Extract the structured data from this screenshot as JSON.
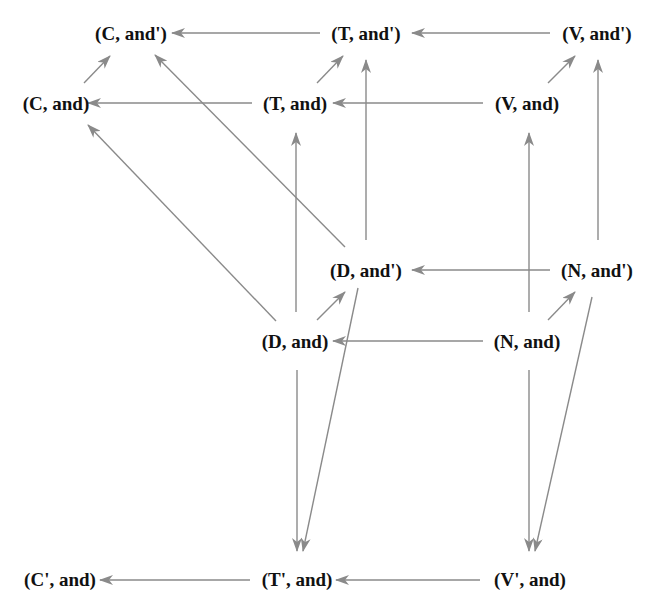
{
  "diagram": {
    "edge_color": "#8a8a8a",
    "text_color": "#111111",
    "nodes": {
      "c_andp": {
        "label": "(C, and')",
        "x": 131,
        "y": 33
      },
      "t_andp": {
        "label": "(T, and')",
        "x": 366,
        "y": 33
      },
      "v_andp": {
        "label": "(V, and')",
        "x": 597,
        "y": 33
      },
      "c_and": {
        "label": "(C, and)",
        "x": 56,
        "y": 103
      },
      "t_and": {
        "label": "(T, and)",
        "x": 295,
        "y": 103
      },
      "v_and": {
        "label": "(V, and)",
        "x": 527,
        "y": 103
      },
      "d_andp": {
        "label": "(D, and')",
        "x": 366,
        "y": 270
      },
      "n_andp": {
        "label": "(N, and')",
        "x": 597,
        "y": 270
      },
      "d_and": {
        "label": "(D, and)",
        "x": 295,
        "y": 341
      },
      "n_and": {
        "label": "(N, and)",
        "x": 527,
        "y": 341
      },
      "cp_and": {
        "label": "(C', and)",
        "x": 60,
        "y": 579
      },
      "tp_and": {
        "label": "(T', and)",
        "x": 297,
        "y": 579
      },
      "vp_and": {
        "label": "(V', and)",
        "x": 530,
        "y": 579
      }
    },
    "edges": [
      {
        "from": "t_andp",
        "to": "c_andp",
        "x1": 320,
        "y1": 33,
        "x2": 172,
        "y2": 33
      },
      {
        "from": "v_andp",
        "to": "t_andp",
        "x1": 550,
        "y1": 33,
        "x2": 412,
        "y2": 33
      },
      {
        "from": "t_and",
        "to": "c_and",
        "x1": 252,
        "y1": 103,
        "x2": 88,
        "y2": 103
      },
      {
        "from": "v_and",
        "to": "t_and",
        "x1": 483,
        "y1": 103,
        "x2": 333,
        "y2": 103
      },
      {
        "from": "c_and",
        "to": "c_andp",
        "x1": 84,
        "y1": 83,
        "x2": 110,
        "y2": 56
      },
      {
        "from": "t_and",
        "to": "t_andp",
        "x1": 317,
        "y1": 83,
        "x2": 343,
        "y2": 56
      },
      {
        "from": "v_and",
        "to": "v_andp",
        "x1": 548,
        "y1": 83,
        "x2": 575,
        "y2": 56
      },
      {
        "from": "d_andp",
        "to": "c_andp",
        "x1": 345,
        "y1": 247,
        "x2": 155,
        "y2": 55
      },
      {
        "from": "d_and",
        "to": "c_and",
        "x1": 276,
        "y1": 321,
        "x2": 88,
        "y2": 125
      },
      {
        "from": "d_andp",
        "to": "t_andp",
        "x1": 366,
        "y1": 240,
        "x2": 366,
        "y2": 60
      },
      {
        "from": "d_and",
        "to": "t_and",
        "x1": 296,
        "y1": 312,
        "x2": 296,
        "y2": 133
      },
      {
        "from": "n_andp",
        "to": "v_andp",
        "x1": 598,
        "y1": 240,
        "x2": 598,
        "y2": 60
      },
      {
        "from": "n_and",
        "to": "v_and",
        "x1": 529,
        "y1": 312,
        "x2": 529,
        "y2": 133
      },
      {
        "from": "n_andp",
        "to": "d_andp",
        "x1": 550,
        "y1": 270,
        "x2": 412,
        "y2": 270
      },
      {
        "from": "n_and",
        "to": "d_and",
        "x1": 483,
        "y1": 341,
        "x2": 333,
        "y2": 341
      },
      {
        "from": "d_and",
        "to": "d_andp",
        "x1": 317,
        "y1": 320,
        "x2": 345,
        "y2": 292
      },
      {
        "from": "n_and",
        "to": "n_andp",
        "x1": 548,
        "y1": 320,
        "x2": 575,
        "y2": 292
      },
      {
        "from": "d_and",
        "to": "tp_and",
        "x1": 297,
        "y1": 370,
        "x2": 297,
        "y2": 551
      },
      {
        "from": "d_andp",
        "to": "tp_and",
        "x1": 358,
        "y1": 288,
        "x2": 303,
        "y2": 551
      },
      {
        "from": "n_and",
        "to": "vp_and",
        "x1": 529,
        "y1": 370,
        "x2": 529,
        "y2": 551
      },
      {
        "from": "n_andp",
        "to": "vp_and",
        "x1": 592,
        "y1": 297,
        "x2": 535,
        "y2": 551
      },
      {
        "from": "tp_and",
        "to": "cp_and",
        "x1": 250,
        "y1": 580,
        "x2": 100,
        "y2": 580
      },
      {
        "from": "vp_and",
        "to": "tp_and",
        "x1": 480,
        "y1": 580,
        "x2": 336,
        "y2": 580
      }
    ]
  }
}
